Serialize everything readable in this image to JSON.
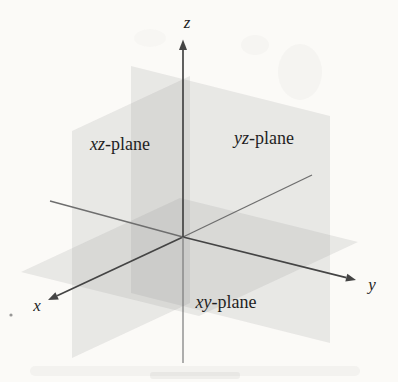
{
  "figure": {
    "type": "3d-coordinate-planes-diagram",
    "axis_labels": {
      "x": "x",
      "y": "y",
      "z": "z"
    },
    "plane_labels": {
      "xz": {
        "axes": "xz",
        "suffix": "-plane"
      },
      "yz": {
        "axes": "yz",
        "suffix": "-plane"
      },
      "xy": {
        "axes": "xy",
        "suffix": "-plane"
      }
    },
    "colors": {
      "background": "#fbfaf7",
      "plane_fill": "#8c8c8c",
      "axis_line": "#444444",
      "axis_line_negative": "#6e6e6e",
      "axis_line_negative_z": "#7a7a7a",
      "text": "#1f1f1f"
    }
  }
}
